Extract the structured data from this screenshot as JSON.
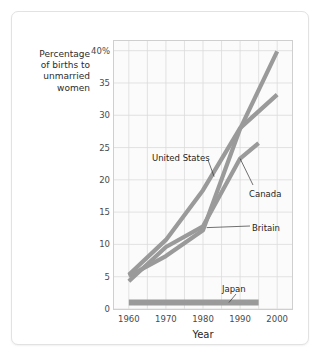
{
  "chart_data": {
    "type": "line",
    "title": "",
    "xlabel": "Year",
    "ylabel": "Percentage\nof births to\nunmarried\nwomen",
    "xlim": [
      1956,
      2004
    ],
    "ylim": [
      0,
      41.5
    ],
    "xticks": [
      1960,
      1970,
      1980,
      1990,
      2000
    ],
    "xticklabels": [
      "1960",
      "1970",
      "1980",
      "1990",
      "2000"
    ],
    "yticks": [
      0,
      5,
      10,
      15,
      20,
      25,
      30,
      35,
      40
    ],
    "yticklabels": [
      "0",
      "5",
      "10",
      "15",
      "20",
      "25",
      "30",
      "35",
      "40%"
    ],
    "grid": true,
    "grid_x_minor_step": 5,
    "legend_position": "inline-annotations",
    "line_color": "#9a9a9a",
    "grid_color": "#dcdcdc",
    "plot_background": "#fbfbfb",
    "series": [
      {
        "name": "United States",
        "x": [
          1960,
          1970,
          1980,
          1990,
          2000
        ],
        "values": [
          5.3,
          10.7,
          18.4,
          28.0,
          33.2
        ]
      },
      {
        "name": "Canada",
        "x": [
          1960,
          1970,
          1980,
          1990,
          1995
        ],
        "values": [
          4.3,
          9.6,
          12.8,
          23.3,
          25.7
        ]
      },
      {
        "name": "Britain",
        "x": [
          1960,
          1970,
          1980,
          1990,
          2000
        ],
        "values": [
          5.1,
          8.2,
          12.2,
          27.9,
          39.9
        ]
      },
      {
        "name": "Japan",
        "x": [
          1960,
          1970,
          1980,
          1990,
          1995
        ],
        "values": [
          1.0,
          1.0,
          1.0,
          1.0,
          1.0
        ]
      }
    ],
    "annotations": [
      {
        "label": "United States",
        "anchor_x": 1983,
        "anchor_y": 20.5
      },
      {
        "label": "Canada",
        "anchor_x": 1990,
        "anchor_y": 23.3
      },
      {
        "label": "Britain",
        "anchor_x": 1981,
        "anchor_y": 12.6
      },
      {
        "label": "Japan",
        "anchor_x": 1987,
        "anchor_y": 1.0
      }
    ]
  },
  "axis": {
    "y_title": "Percentage\nof births to\nunmarried\nwomen",
    "x_title": "Year",
    "y_labels": [
      "40%",
      "35",
      "30",
      "25",
      "20",
      "15",
      "10",
      "5",
      "0"
    ],
    "x_labels": [
      "1960",
      "1970",
      "1980",
      "1990",
      "2000"
    ]
  },
  "labels": {
    "united_states": "United States",
    "canada": "Canada",
    "britain": "Britain",
    "japan": "Japan"
  }
}
